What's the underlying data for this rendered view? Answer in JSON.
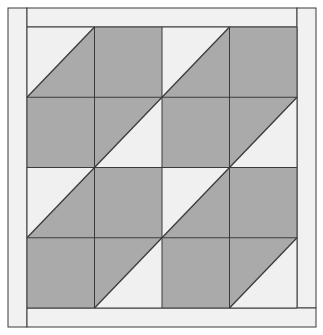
{
  "diagram": {
    "colors": {
      "background": "#ffffff",
      "border_fill": "#f1f1f1",
      "light_fill": "#f0f0f0",
      "dark_fill": "#aaaaaa",
      "line": "#3a3a3a"
    },
    "frame": {
      "outer": {
        "x": 8,
        "y": 8,
        "w": 308,
        "h": 319
      },
      "inner_grid": {
        "x": 27,
        "y": 27,
        "w": 270,
        "h": 281
      }
    },
    "grid": {
      "rows": 4,
      "cols": 4,
      "cells": [
        [
          "hst-light-top-left",
          "solid-dark",
          "hst-light-top-left",
          "solid-dark"
        ],
        [
          "solid-dark",
          "hst-light-bottom-right",
          "solid-dark",
          "hst-light-bottom-right"
        ],
        [
          "hst-light-top-left",
          "solid-dark",
          "hst-light-top-left",
          "solid-dark"
        ],
        [
          "solid-dark",
          "hst-light-bottom-right",
          "solid-dark",
          "hst-light-bottom-right"
        ]
      ]
    }
  }
}
